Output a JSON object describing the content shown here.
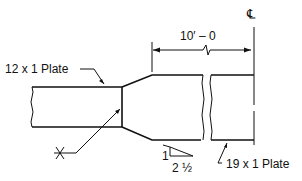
{
  "diagram": {
    "labels": {
      "centerline": "℄",
      "dimension": "10′ – 0",
      "left_plate": "12 x 1 Plate",
      "right_plate": "19 x 1 Plate",
      "slope_rise": "1",
      "slope_run": "2 ½"
    }
  }
}
